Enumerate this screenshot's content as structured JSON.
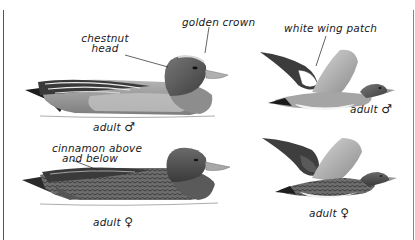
{
  "plate": {
    "subject": "wigeon identification plate",
    "figures": [
      {
        "id": "male-swimming",
        "pose": "swimming",
        "caption": "adult",
        "sex_symbol": "♂",
        "annotations": [
          {
            "text_lines": [
              "chestnut",
              "head"
            ]
          },
          {
            "text_lines": [
              "golden crown"
            ]
          }
        ]
      },
      {
        "id": "male-flying",
        "pose": "flying",
        "caption": "adult",
        "sex_symbol": "♂",
        "annotations": [
          {
            "text_lines": [
              "white wing patch"
            ]
          }
        ]
      },
      {
        "id": "female-swimming",
        "pose": "swimming",
        "caption": "adult",
        "sex_symbol": "♀",
        "annotations": [
          {
            "text_lines": [
              "cinnamon above",
              "and below"
            ]
          }
        ]
      },
      {
        "id": "female-flying",
        "pose": "flying",
        "caption": "adult",
        "sex_symbol": "♀",
        "annotations": []
      }
    ]
  },
  "colors": {
    "background": "#ffffff",
    "ink": "#1a1a1a",
    "male_head": "#5a5a5a",
    "body_gray": "#9a9a9a",
    "dark_feather": "#2a2a2a"
  }
}
